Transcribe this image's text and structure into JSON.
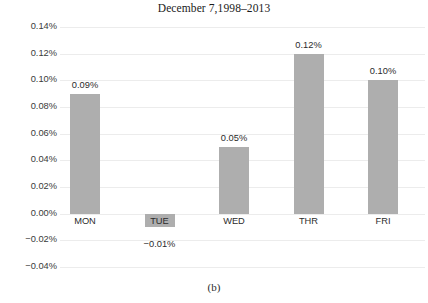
{
  "caption": "(b)",
  "chart_data": {
    "type": "bar",
    "title": "December 7,1998–2013",
    "xlabel": "",
    "ylabel": "",
    "categories": [
      "MON",
      "TUE",
      "WED",
      "THR",
      "FRI"
    ],
    "values": [
      0.09,
      -0.01,
      0.05,
      0.12,
      0.1
    ],
    "value_labels": [
      "0.09%",
      "−0.01%",
      "0.05%",
      "0.12%",
      "0.10%"
    ],
    "ylim": [
      -0.04,
      0.14
    ],
    "ytick_values": [
      0.14,
      0.12,
      0.1,
      0.08,
      0.06,
      0.04,
      0.02,
      0.0,
      -0.02,
      -0.04
    ],
    "ytick_labels": [
      "0.14%",
      "0.12%",
      "0.10%",
      "0.08%",
      "0.06%",
      "0.04%",
      "0.02%",
      "0.00%",
      "−0.02%",
      "−0.04%"
    ],
    "grid": true,
    "legend": false,
    "unit": "%",
    "bar_color": "#aeaeae",
    "grid_color": "#ececec"
  }
}
